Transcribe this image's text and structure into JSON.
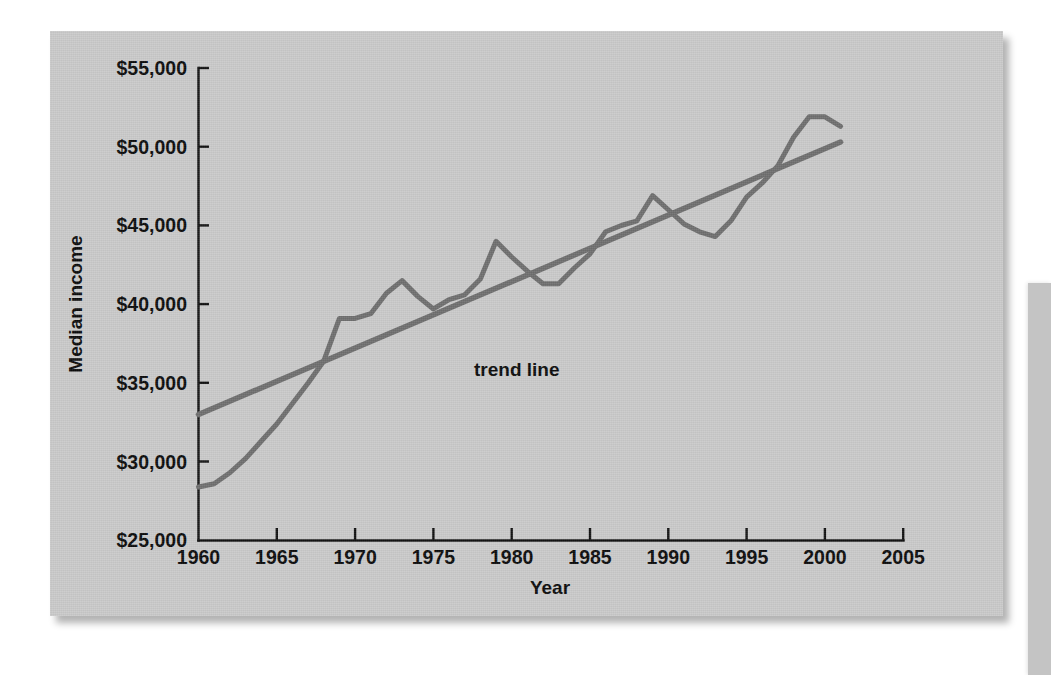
{
  "chart_data": {
    "type": "line",
    "title": "",
    "xlabel": "Year",
    "ylabel": "Median income",
    "xlim": [
      1960,
      2005
    ],
    "ylim": [
      25000,
      55000
    ],
    "grid": false,
    "legend": "none",
    "x_tick_labels": [
      "1960",
      "1965",
      "1970",
      "1975",
      "1980",
      "1985",
      "1990",
      "1995",
      "2000",
      "2005"
    ],
    "x_ticks": [
      1960,
      1965,
      1970,
      1975,
      1980,
      1985,
      1990,
      1995,
      2000,
      2005
    ],
    "y_tick_labels": [
      "$25,000",
      "$30,000",
      "$35,000",
      "$40,000",
      "$45,000",
      "$50,000",
      "$55,000"
    ],
    "y_ticks": [
      25000,
      30000,
      35000,
      40000,
      45000,
      50000,
      55000
    ],
    "annotations": [
      {
        "text": "trend line",
        "x": 1977.5,
        "y": 37400
      }
    ],
    "series": [
      {
        "name": "Median income",
        "color": "#6e6e6e",
        "x": [
          1960,
          1961,
          1962,
          1963,
          1964,
          1965,
          1966,
          1967,
          1968,
          1969,
          1970,
          1971,
          1972,
          1973,
          1974,
          1975,
          1976,
          1977,
          1978,
          1979,
          1980,
          1981,
          1982,
          1983,
          1984,
          1985,
          1986,
          1987,
          1988,
          1989,
          1990,
          1991,
          1992,
          1993,
          1994,
          1995,
          1996,
          1997,
          1998,
          1999,
          2000,
          2001
        ],
        "values": [
          28400,
          28600,
          29300,
          30200,
          31300,
          32400,
          33700,
          35000,
          36400,
          39100,
          39100,
          39400,
          40700,
          41500,
          40500,
          39700,
          40300,
          40600,
          41600,
          44000,
          43000,
          42100,
          41300,
          41300,
          42300,
          43200,
          44600,
          45000,
          45300,
          46900,
          46000,
          45100,
          44600,
          44300,
          45300,
          46800,
          47700,
          48800,
          50600,
          51900,
          51900,
          51300
        ]
      },
      {
        "name": "trend line",
        "color": "#6e6e6e",
        "x": [
          1960,
          2001
        ],
        "values": [
          33000,
          50300
        ]
      }
    ]
  }
}
